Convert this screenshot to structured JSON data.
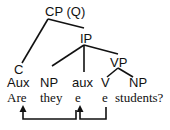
{
  "diagram": {
    "type": "syntax-tree",
    "nodes": {
      "root": "CP (Q)",
      "ip": "IP",
      "vp": "VP",
      "c": "C"
    },
    "categories": [
      "Aux",
      "NP",
      "aux",
      "V",
      "NP"
    ],
    "words": [
      "Are",
      "they",
      "e",
      "e",
      "students?"
    ],
    "movement_arrows": [
      {
        "from": "e (V)",
        "to": "e (aux)"
      },
      {
        "from": "e (aux)",
        "to": "Are"
      }
    ],
    "colors": {
      "line": "#111111",
      "background": "#ffffff"
    }
  }
}
